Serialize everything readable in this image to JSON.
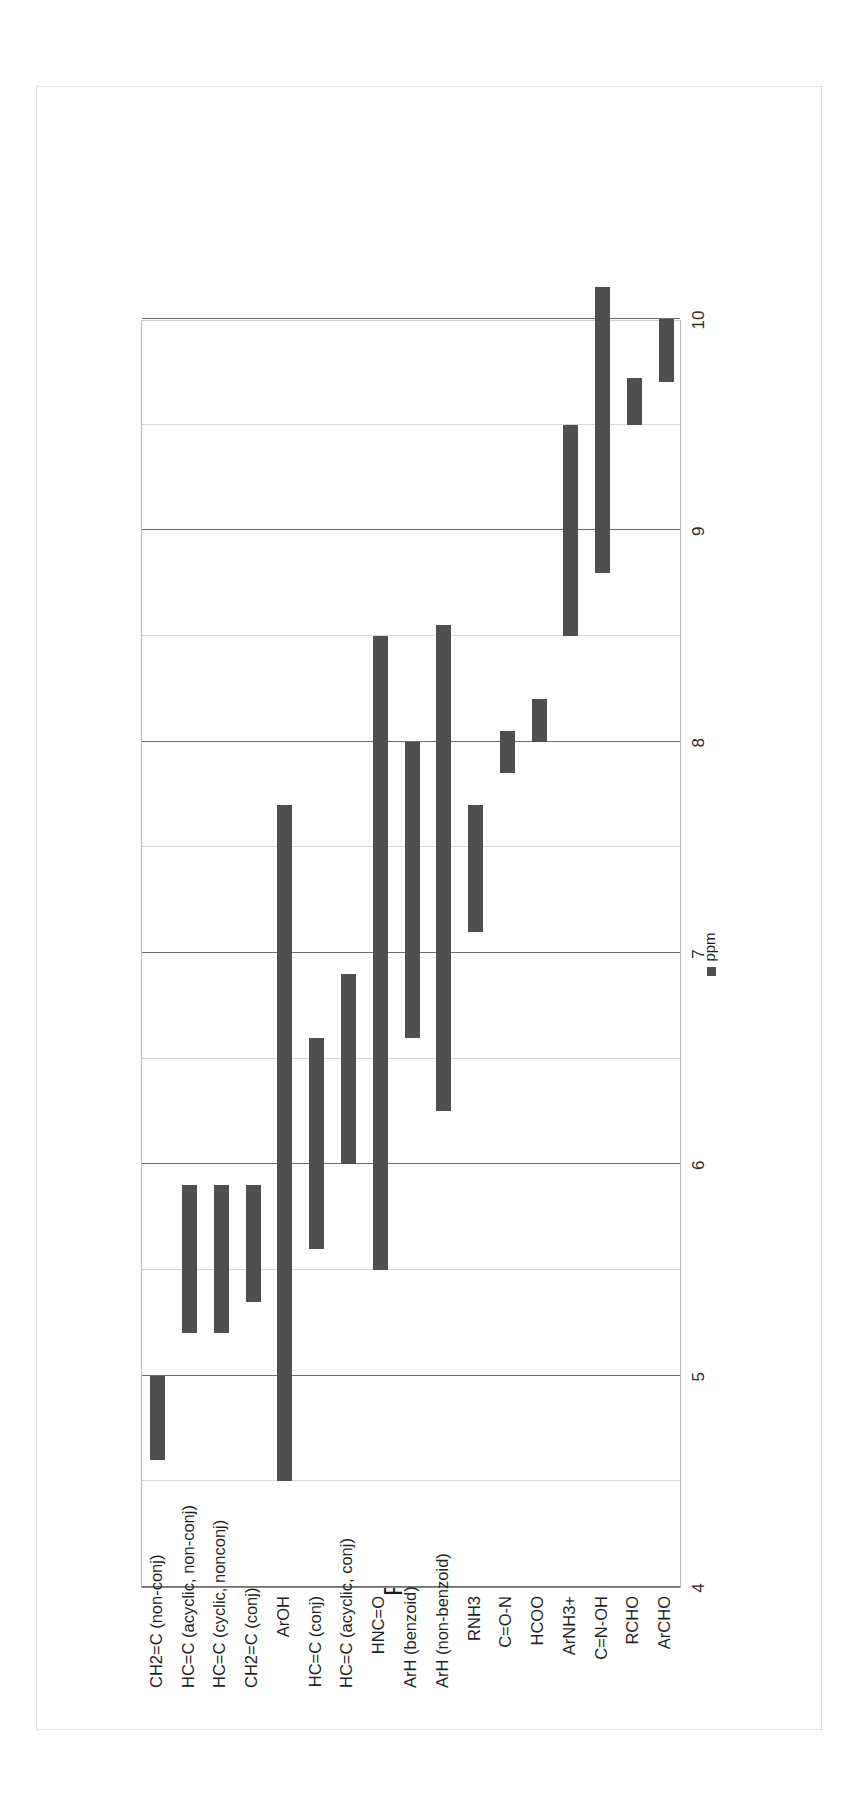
{
  "chart_data": {
    "type": "bar",
    "orientation": "floating-range-bars",
    "rotation": "page rotated 90 degrees; value axis reads top-to-bottom in the image",
    "title": "Proton Chemical Shift",
    "xlabel": "",
    "ylabel": "",
    "legend": [
      "ppm"
    ],
    "legend_position": "bottom",
    "grid": true,
    "axis_range": [
      4,
      10
    ],
    "axis_tick_labels": [
      "4",
      "5",
      "6",
      "7",
      "8",
      "9",
      "10"
    ],
    "axis_major_ticks": [
      4,
      5,
      6,
      7,
      8,
      9,
      10
    ],
    "axis_minor_ticks": [
      4.5,
      5.5,
      6.5,
      7.5,
      8.5,
      9.5
    ],
    "categories": [
      "CH2=C (non-conj)",
      "HC=C (acyclic, non-conj)",
      "HC=C (cyclic, nonconj)",
      "CH2=C (conj)",
      "ArOH",
      "HC=C (conj)",
      "HC=C (acyclic, conj)",
      "HNC=O",
      "ArH (benzoid)",
      "ArH (non-benzoid)",
      "RNH3",
      "C=O-N",
      "HCOO",
      "ArNH3+",
      "C=N-OH",
      "RCHO",
      "ArCHO"
    ],
    "ranges": [
      {
        "category": "CH2=C (non-conj)",
        "start": 4.6,
        "end": 5.0
      },
      {
        "category": "HC=C (acyclic, non-conj)",
        "start": 5.2,
        "end": 5.9
      },
      {
        "category": "HC=C (cyclic, nonconj)",
        "start": 5.2,
        "end": 5.9
      },
      {
        "category": "CH2=C (conj)",
        "start": 5.35,
        "end": 5.9
      },
      {
        "category": "ArOH",
        "start": 4.5,
        "end": 7.7
      },
      {
        "category": "HC=C (conj)",
        "start": 5.6,
        "end": 6.6
      },
      {
        "category": "HC=C (acyclic, conj)",
        "start": 6.0,
        "end": 6.9
      },
      {
        "category": "HNC=O",
        "start": 5.5,
        "end": 8.5
      },
      {
        "category": "ArH (benzoid)",
        "start": 6.6,
        "end": 8.0
      },
      {
        "category": "ArH (non-benzoid)",
        "start": 6.25,
        "end": 8.55
      },
      {
        "category": "RNH3",
        "start": 7.1,
        "end": 7.7
      },
      {
        "category": "C=O-N",
        "start": 7.85,
        "end": 8.05
      },
      {
        "category": "HCOO",
        "start": 8.0,
        "end": 8.2
      },
      {
        "category": "ArNH3+",
        "start": 8.5,
        "end": 9.5
      },
      {
        "category": "C=N-OH",
        "start": 8.8,
        "end": 10.15
      },
      {
        "category": "RCHO",
        "start": 9.5,
        "end": 9.72
      },
      {
        "category": "ArCHO",
        "start": 9.7,
        "end": 10.0
      }
    ],
    "colors": {
      "bar": "#4f4f4f",
      "gridline": "#d8d8d8",
      "gridline_major": "#6e6e6e",
      "plot_border": "#b9b9b9",
      "text": "#1f1f1f",
      "background": "#ffffff"
    }
  }
}
